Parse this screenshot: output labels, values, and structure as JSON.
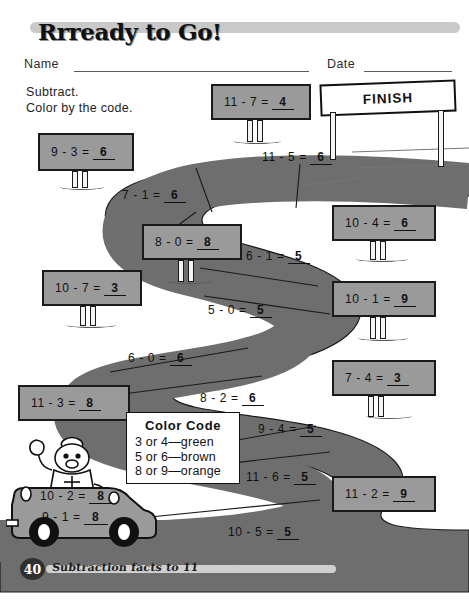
{
  "header": {
    "title": "Rrready to Go!",
    "name_label": "Name",
    "date_label": "Date"
  },
  "instructions": {
    "line1": "Subtract.",
    "line2": "Color by the code."
  },
  "finish": {
    "label": "FINISH"
  },
  "color_code": {
    "title": "Color  Code",
    "entries": [
      "3 or 4—green",
      "5 or 6—brown",
      "8 or 9—orange"
    ]
  },
  "signs": [
    {
      "problem": "9 - 3 =",
      "answer": "6"
    },
    {
      "problem": "11 - 7 =",
      "answer": "4"
    },
    {
      "problem": "8 - 0 =",
      "answer": "8"
    },
    {
      "problem": "10 - 4 =",
      "answer": "6"
    },
    {
      "problem": "10 - 7 =",
      "answer": "3"
    },
    {
      "problem": "10 - 1 =",
      "answer": "9"
    },
    {
      "problem": "7 - 4 =",
      "answer": "3"
    },
    {
      "problem": "11 - 3 =",
      "answer": "8"
    },
    {
      "problem": "11 - 2 =",
      "answer": "9"
    }
  ],
  "road_equations": [
    {
      "problem": "11 - 5 =",
      "answer": "6"
    },
    {
      "problem": "7 - 1 =",
      "answer": "6"
    },
    {
      "problem": "6 - 1 =",
      "answer": "5"
    },
    {
      "problem": "5 - 0 =",
      "answer": "5"
    },
    {
      "problem": "6 - 0 =",
      "answer": "6"
    },
    {
      "problem": "8 - 2 =",
      "answer": "6"
    },
    {
      "problem": "9 - 4 =",
      "answer": "5"
    },
    {
      "problem": "11 - 6 =",
      "answer": "5"
    },
    {
      "problem": "10 - 5 =",
      "answer": "5"
    }
  ],
  "car_equations": [
    {
      "problem": "10 - 2 =",
      "answer": "8"
    },
    {
      "problem": "9 - 1 =",
      "answer": "8"
    }
  ],
  "footer": {
    "page_number": "40",
    "caption": "Subtraction facts to 11"
  },
  "colors": {
    "road_fill": "#6e6e6e",
    "sign_fill": "#9a9a9a",
    "ink": "#111111",
    "squiggle": "#c9c9c9"
  }
}
